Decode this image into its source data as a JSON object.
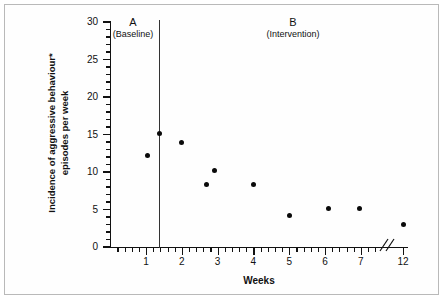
{
  "figure": {
    "x_title": "Weeks",
    "y_title_line1": "Incidence of aggressive behaviour*",
    "y_title_line2": "episodes per week",
    "phase_a_letter": "A",
    "phase_a_sub": "(Baseline)",
    "phase_b_letter": "B",
    "phase_b_sub": "(Intervention)",
    "colors": {
      "ink": "#111111",
      "point": "#0a0a0a",
      "frame": "#b9b9b9",
      "background": "#ffffff"
    }
  },
  "chart_data": {
    "type": "scatter",
    "title": "",
    "subtitle": "",
    "xlabel": "Weeks",
    "ylabel": "Incidence of aggressive behaviour* episodes per week",
    "xlim": [
      0,
      13
    ],
    "ylim": [
      0,
      30
    ],
    "grid": false,
    "legend": "none",
    "y_ticks_major": [
      0,
      5,
      10,
      15,
      20,
      25,
      30
    ],
    "y_tick_labels": [
      "0",
      "5",
      "10",
      "15",
      "20",
      "25",
      "30"
    ],
    "y_minor_interval": 1,
    "x_ticks_major": [
      1,
      2,
      3,
      4,
      5,
      6,
      7,
      12
    ],
    "x_tick_labels": [
      "1",
      "2",
      "3",
      "4",
      "5",
      "6",
      "7",
      "12"
    ],
    "x_axis_break_after": 7,
    "x_axis_break_symbol": "//",
    "phase_change_line_x": 1.35,
    "annotations": [
      {
        "text": "A",
        "sub": "(Baseline)",
        "phase": "A"
      },
      {
        "text": "B",
        "sub": "(Intervention)",
        "phase": "B"
      }
    ],
    "series": [
      {
        "name": "Aggressive behaviour episodes per week",
        "marker": "filled-circle",
        "color": "#0a0a0a",
        "points": [
          {
            "x": 1.05,
            "y": 12.2,
            "phase": "A"
          },
          {
            "x": 1.38,
            "y": 15.2,
            "phase": "A"
          },
          {
            "x": 2.0,
            "y": 14.0,
            "phase": "B"
          },
          {
            "x": 2.68,
            "y": 8.3,
            "phase": "B"
          },
          {
            "x": 2.92,
            "y": 10.2,
            "phase": "B"
          },
          {
            "x": 4.0,
            "y": 8.3,
            "phase": "B"
          },
          {
            "x": 5.0,
            "y": 4.2,
            "phase": "B"
          },
          {
            "x": 6.1,
            "y": 5.2,
            "phase": "B"
          },
          {
            "x": 6.95,
            "y": 5.2,
            "phase": "B"
          },
          {
            "x": 12.0,
            "y": 3.0,
            "phase": "B"
          }
        ]
      }
    ]
  }
}
